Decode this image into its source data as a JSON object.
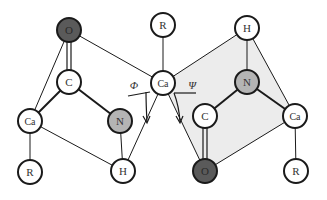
{
  "diagram": {
    "colors": {
      "oxygen_fill": "#5a5a5a",
      "nitrogen_fill": "#b4b4b4",
      "default_fill": "#ffffff",
      "plane_fill": "#ececec",
      "stroke": "#1a1a1a",
      "label": "#333333"
    },
    "angles": {
      "phi": "Φ",
      "psi": "Ψ"
    },
    "nodes": [
      {
        "id": "o1",
        "label": "O",
        "x": 69,
        "y": 30,
        "type": "oxygen"
      },
      {
        "id": "r1",
        "label": "R",
        "x": 163,
        "y": 25,
        "type": "default"
      },
      {
        "id": "h1",
        "label": "H",
        "x": 247,
        "y": 28,
        "type": "default"
      },
      {
        "id": "c1",
        "label": "C",
        "x": 69,
        "y": 82,
        "type": "default"
      },
      {
        "id": "ca2",
        "label": "Ca",
        "x": 163,
        "y": 83,
        "type": "default"
      },
      {
        "id": "n2",
        "label": "N",
        "x": 247,
        "y": 82,
        "type": "nitrogen"
      },
      {
        "id": "ca1",
        "label": "Ca",
        "x": 30,
        "y": 121,
        "type": "default"
      },
      {
        "id": "n1",
        "label": "N",
        "x": 120,
        "y": 121,
        "type": "nitrogen"
      },
      {
        "id": "c2",
        "label": "C",
        "x": 205,
        "y": 116,
        "type": "default"
      },
      {
        "id": "ca3",
        "label": "Ca",
        "x": 295,
        "y": 116,
        "type": "default"
      },
      {
        "id": "r0",
        "label": "R",
        "x": 30,
        "y": 172,
        "type": "default"
      },
      {
        "id": "h0",
        "label": "H",
        "x": 123,
        "y": 171,
        "type": "default"
      },
      {
        "id": "o2",
        "label": "O",
        "x": 205,
        "y": 171,
        "type": "oxygen"
      },
      {
        "id": "r3",
        "label": "R",
        "x": 296,
        "y": 171,
        "type": "default"
      }
    ]
  }
}
